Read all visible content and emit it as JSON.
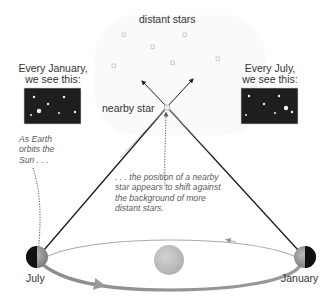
{
  "labels": {
    "distant_stars": "distant stars",
    "nearby_star": "nearby star",
    "january_view_line1": "Every January,",
    "january_view_line2": "we see this:",
    "july_view_line1": "Every July,",
    "july_view_line2": "we see this:",
    "july": "July",
    "january": "January"
  },
  "notes": {
    "earth_orbits": [
      "As Earth",
      "orbits the",
      "Sun . . ."
    ],
    "position_shift": [
      ". . . the position of a nearby",
      "star appears to shift against",
      "the background of more",
      "distant stars."
    ]
  },
  "colors": {
    "sky_panel": "#1e1e1e",
    "orbit": "#a8a8a8",
    "sun": "#c4c4c4",
    "earth_dark": "#111111",
    "earth_light": "#9a9a9a",
    "sightline": "#1a1a1a",
    "distant_star": "#c8c8c8"
  },
  "distant_star_positions": [
    [
      124,
      35
    ],
    [
      185,
      35
    ],
    [
      153,
      46
    ],
    [
      113,
      66
    ],
    [
      173,
      63
    ],
    [
      217,
      59
    ]
  ],
  "panels": {
    "january": {
      "stars": [
        [
          34,
          98,
          1.2
        ],
        [
          64,
          96,
          1.2
        ],
        [
          48,
          104,
          1.2
        ],
        [
          39,
          111,
          2.2
        ],
        [
          29,
          115,
          1
        ],
        [
          59,
          113,
          1
        ],
        [
          75,
          112,
          1.2
        ]
      ]
    },
    "july": {
      "stars": [
        [
          249,
          96,
          1.2
        ],
        [
          279,
          96,
          1.2
        ],
        [
          265,
          104,
          1.2
        ],
        [
          286,
          108,
          2.2
        ],
        [
          255,
          115,
          1
        ],
        [
          275,
          113,
          1
        ],
        [
          292,
          112,
          1.2
        ]
      ]
    }
  }
}
